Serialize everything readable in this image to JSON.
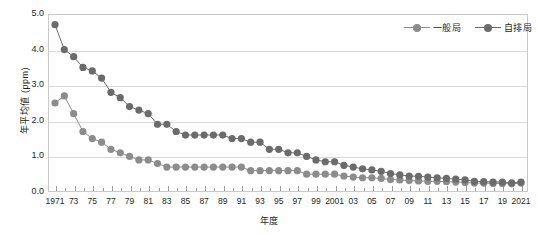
{
  "chart_data": {
    "type": "line",
    "title": "",
    "xlabel": "年度",
    "ylabel": "年平均値 (ppm)",
    "ylim": [
      0.0,
      5.0
    ],
    "ytick_labels": [
      "0.0",
      "1.0",
      "2.0",
      "3.0",
      "4.0",
      "5.0"
    ],
    "ytick_values": [
      0.0,
      1.0,
      2.0,
      3.0,
      4.0,
      5.0
    ],
    "grid": true,
    "legend_position": "top-right",
    "xlim": [
      1971,
      2021
    ],
    "x": [
      1971,
      1972,
      1973,
      1974,
      1975,
      1976,
      1977,
      1978,
      1979,
      1980,
      1981,
      1982,
      1983,
      1984,
      1985,
      1986,
      1987,
      1988,
      1989,
      1990,
      1991,
      1992,
      1993,
      1994,
      1995,
      1996,
      1997,
      1998,
      1999,
      2000,
      2001,
      2002,
      2003,
      2004,
      2005,
      2006,
      2007,
      2008,
      2009,
      2010,
      2011,
      2012,
      2013,
      2014,
      2015,
      2016,
      2017,
      2018,
      2019,
      2020,
      2021
    ],
    "xtick_labels": [
      "1971",
      "73",
      "75",
      "77",
      "79",
      "81",
      "83",
      "85",
      "87",
      "89",
      "91",
      "93",
      "95",
      "97",
      "99",
      "2001",
      "03",
      "05",
      "07",
      "09",
      "11",
      "13",
      "15",
      "17",
      "19",
      "2021"
    ],
    "xtick_values": [
      1971,
      1973,
      1975,
      1977,
      1979,
      1981,
      1983,
      1985,
      1987,
      1989,
      1991,
      1993,
      1995,
      1997,
      1999,
      2001,
      2003,
      2005,
      2007,
      2009,
      2011,
      2013,
      2015,
      2017,
      2019,
      2021
    ],
    "series": [
      {
        "name": "一般局",
        "color": "#8c8c8c",
        "values": [
          2.5,
          2.7,
          2.2,
          1.7,
          1.5,
          1.4,
          1.2,
          1.1,
          1.0,
          0.9,
          0.9,
          0.8,
          0.7,
          0.7,
          0.7,
          0.7,
          0.7,
          0.7,
          0.7,
          0.7,
          0.7,
          0.6,
          0.6,
          0.6,
          0.6,
          0.6,
          0.6,
          0.5,
          0.5,
          0.5,
          0.5,
          0.45,
          0.42,
          0.4,
          0.4,
          0.38,
          0.35,
          0.34,
          0.32,
          0.31,
          0.3,
          0.3,
          0.29,
          0.28,
          0.27,
          0.25,
          0.25,
          0.24,
          0.24,
          0.23,
          0.25
        ]
      },
      {
        "name": "自排局",
        "color": "#6b6b6b",
        "values": [
          4.7,
          4.0,
          3.8,
          3.5,
          3.4,
          3.2,
          2.8,
          2.65,
          2.4,
          2.3,
          2.2,
          1.9,
          1.9,
          1.7,
          1.6,
          1.6,
          1.6,
          1.6,
          1.6,
          1.5,
          1.5,
          1.4,
          1.4,
          1.2,
          1.2,
          1.1,
          1.1,
          1.0,
          0.9,
          0.85,
          0.85,
          0.75,
          0.7,
          0.65,
          0.62,
          0.58,
          0.52,
          0.48,
          0.45,
          0.44,
          0.42,
          0.4,
          0.38,
          0.36,
          0.34,
          0.3,
          0.29,
          0.28,
          0.28,
          0.26,
          0.28
        ]
      }
    ]
  },
  "legend": {
    "items": [
      {
        "label": "一般局"
      },
      {
        "label": "自排局"
      }
    ]
  }
}
